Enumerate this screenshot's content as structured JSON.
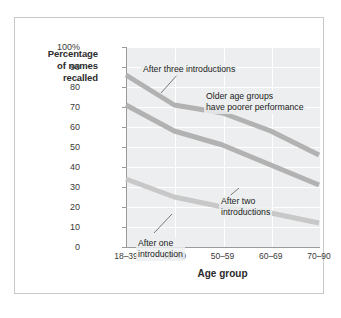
{
  "chart_data": {
    "type": "line",
    "title": "",
    "xlabel": "Age group",
    "ylabel": "Percentage of names recalled",
    "categories": [
      "18–39",
      "40–49",
      "50–59",
      "60–69",
      "70–90"
    ],
    "ylim": [
      0,
      100
    ],
    "ytick_labels": [
      "0",
      "10",
      "20",
      "30",
      "40",
      "50",
      "60",
      "70",
      "80",
      "90",
      "100%"
    ],
    "ytick_values": [
      0,
      10,
      20,
      30,
      40,
      50,
      60,
      70,
      80,
      90,
      100
    ],
    "grid": true,
    "legend_position": "inline-annotations",
    "series": [
      {
        "name": "After three introductions",
        "values": [
          86,
          71,
          67,
          58,
          46
        ],
        "color": "#b2b2b2"
      },
      {
        "name": "After two introductions",
        "values": [
          71,
          58,
          51,
          41,
          31
        ],
        "color": "#b2b2b2"
      },
      {
        "name": "After one introduction",
        "values": [
          34,
          25,
          20,
          17,
          12
        ],
        "color": "#c8c8c8"
      }
    ],
    "annotations": [
      {
        "id": "three",
        "text": "After three introductions"
      },
      {
        "id": "older",
        "text": "Older age groups\nhave poorer performance"
      },
      {
        "id": "two",
        "text": "After two\nintroductions"
      },
      {
        "id": "one",
        "text": "After one\nintroduction"
      }
    ]
  },
  "axis": {
    "y_title_line1": "Percentage",
    "y_title_line2": "of names",
    "y_title_line3": "recalled",
    "x_title": "Age group"
  },
  "colors": {
    "plot_background": "#eceeef",
    "gridline": "#ffffff",
    "axis": "#9a9a9a",
    "frame_border": "#c9c9c9",
    "text": "#2b2b2b",
    "series_dark": "#b2b2b2",
    "series_light": "#c8c8c8",
    "leader_line": "#5a5a5a"
  }
}
